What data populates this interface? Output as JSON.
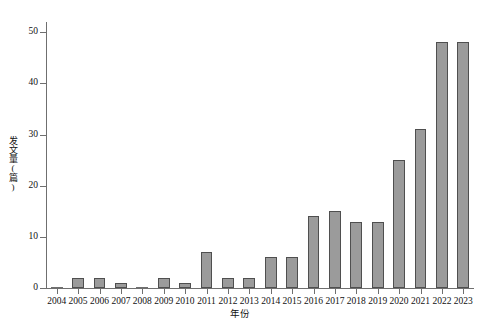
{
  "chart_data": {
    "type": "bar",
    "title": "",
    "xlabel": "年份",
    "ylabel": "发文量(篇)",
    "categories": [
      "2004",
      "2005",
      "2006",
      "2007",
      "2008",
      "2009",
      "2010",
      "2011",
      "2012",
      "2013",
      "2014",
      "2015",
      "2016",
      "2017",
      "2018",
      "2019",
      "2020",
      "2021",
      "2022",
      "2023"
    ],
    "values": [
      0,
      2,
      2,
      1,
      0,
      2,
      1,
      7,
      2,
      2,
      6,
      6,
      14,
      15,
      13,
      13,
      25,
      31,
      48,
      48
    ],
    "ylim": [
      0,
      52
    ],
    "yticks": [
      0,
      10,
      20,
      30,
      40,
      50
    ],
    "ytick_labels": [
      "0",
      "10",
      "20",
      "30",
      "40",
      "50"
    ],
    "grid": false,
    "legend": null,
    "legend_position": "none",
    "bar_fill_color": "#9b9b9b",
    "bar_edge_color": "#4f4f4f",
    "axis_color": "#6f6f6f",
    "background_color": "#ffffff",
    "series": [
      {
        "name": "发文量",
        "values": [
          0,
          2,
          2,
          1,
          0,
          2,
          1,
          7,
          2,
          2,
          6,
          6,
          14,
          15,
          13,
          13,
          25,
          31,
          48,
          48
        ]
      }
    ]
  }
}
